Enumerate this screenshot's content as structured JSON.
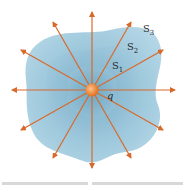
{
  "figure": {
    "surfaces": [
      {
        "name": "S",
        "sub": "1"
      },
      {
        "name": "S",
        "sub": "2"
      },
      {
        "name": "S",
        "sub": "3"
      }
    ],
    "charge_label": "q",
    "field_line_count": 12,
    "colors": {
      "surface_outer": "#a9cfe0",
      "surface_mid": "#93c0d6",
      "surface_inner": "#83b5cd",
      "field_lines": "#d9692a",
      "charge": "#f08a3a"
    }
  }
}
